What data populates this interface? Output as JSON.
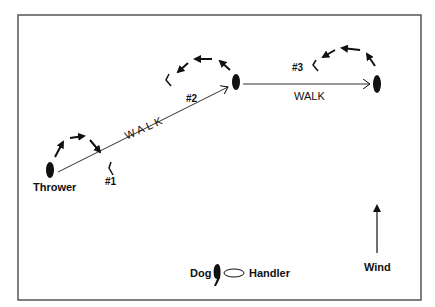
{
  "diagram": {
    "labels": {
      "thrower": "Thrower",
      "mark1": "#1",
      "mark2": "#2",
      "mark3": "#3",
      "walk1": "WALK",
      "walk2": "WALK"
    },
    "legend": {
      "dog_label": "Dog",
      "handler_label": "Handler",
      "wind_label": "Wind"
    },
    "colors": {
      "stroke": "#111111",
      "border": "#555555",
      "background": "#ffffff"
    }
  }
}
